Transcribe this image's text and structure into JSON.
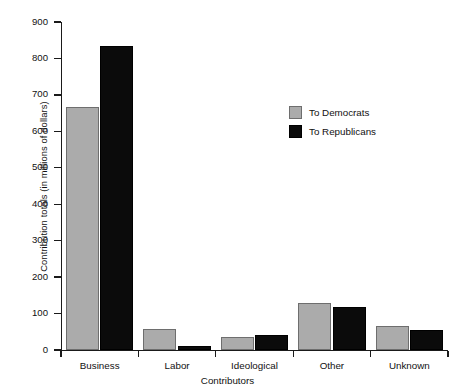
{
  "chart_data": {
    "type": "bar",
    "title": "",
    "xlabel": "Contributors",
    "ylabel": "Contribution totals (in millions of dollars)",
    "categories": [
      "Business",
      "Labor",
      "Ideological",
      "Other",
      "Unknown"
    ],
    "series": [
      {
        "name": "To Democrats",
        "color": "#ababab",
        "values": [
          667,
          58,
          37,
          130,
          65
        ]
      },
      {
        "name": "To Republicans",
        "color": "#0b0b0b",
        "values": [
          835,
          10,
          42,
          118,
          55
        ]
      }
    ],
    "ylim": [
      0,
      900
    ],
    "yticks": [
      0,
      100,
      200,
      300,
      400,
      500,
      600,
      700,
      800,
      900
    ],
    "ytick_labels": [
      "0",
      "100",
      "200",
      "300",
      "400",
      "500",
      "600",
      "700",
      "800",
      "900"
    ],
    "grid": false,
    "legend_position": "upper-right-inside"
  },
  "legend": {
    "entries": [
      {
        "label": "To Democrats"
      },
      {
        "label": "To Republicans"
      }
    ]
  }
}
